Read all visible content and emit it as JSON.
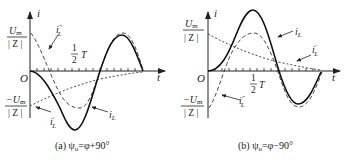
{
  "figure": {
    "panels": [
      {
        "id": "a",
        "caption_prefix": "(a)",
        "caption_formula": "ψu=φ+90°",
        "y_axis_label": "i",
        "x_axis_label": "t",
        "origin_label": "O",
        "pos_level": {
          "num": "Um",
          "den": "|Z|"
        },
        "neg_level": {
          "num": "−Um",
          "den": "|Z|"
        },
        "half_period_label": {
          "num": "1",
          "den": "2",
          "suffix": "T"
        },
        "curves": [
          {
            "name": "iL",
            "label": "iL",
            "style": "solid"
          },
          {
            "name": "iL_double_prime",
            "label": "iL″",
            "style": "dashed"
          },
          {
            "name": "iL_prime",
            "label": "iL′",
            "style": "dotted"
          }
        ]
      },
      {
        "id": "b",
        "caption_prefix": "(b)",
        "caption_formula": "ψu=φ−90°",
        "y_axis_label": "i",
        "x_axis_label": "t",
        "origin_label": "O",
        "pos_level": {
          "num": "Um",
          "den": "|Z|"
        },
        "neg_level": {
          "num": "−Um",
          "den": "|Z|"
        },
        "half_period_label": {
          "num": "1",
          "den": "2",
          "suffix": "T"
        },
        "curves": [
          {
            "name": "iL",
            "label": "iL",
            "style": "solid"
          },
          {
            "name": "iL_prime",
            "label": "iL′",
            "style": "dotted"
          },
          {
            "name": "iL_double_prime",
            "label": "iL″",
            "style": "dashed"
          }
        ]
      }
    ],
    "labels": {
      "a_caption": "(a)  ψ",
      "a_caption_sub": "u",
      "a_caption_rest": "=φ+90°",
      "b_caption": "(b)  ψ",
      "b_caption_sub": "u",
      "b_caption_rest": "=φ−90°",
      "i": "i",
      "t": "t",
      "O": "O",
      "Um": "U",
      "m_sub": "m",
      "negUm": "−U",
      "Z": "| Z |",
      "one": "1",
      "two": "2",
      "T": "T",
      "iL": "i",
      "L_sub": "L",
      "prime": "′",
      "dprime": "″"
    }
  }
}
